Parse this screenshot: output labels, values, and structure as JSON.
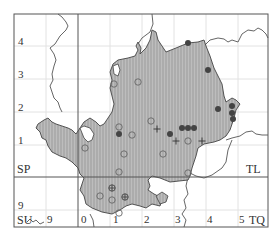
{
  "map": {
    "title": "",
    "colors": {
      "frame": "#555555",
      "grid": "#dddddd",
      "county_fill": "#b8b8b8",
      "hatch": "#9a9a9a",
      "outline": "#444444",
      "marker_dark": "#444444",
      "marker_open": "#666666"
    },
    "square_labels": {
      "sp": "SP",
      "tl": "TL",
      "su": "SU",
      "tq": "TQ"
    },
    "y_ticks": [
      "4",
      "3",
      "2",
      "1",
      "9"
    ],
    "x_ticks": [
      "9",
      "0",
      "1",
      "2",
      "3",
      "4",
      "5"
    ],
    "markers": {
      "filled": [
        {
          "x": 188,
          "y": 43
        },
        {
          "x": 208,
          "y": 70
        },
        {
          "x": 218,
          "y": 109
        },
        {
          "x": 232,
          "y": 106
        },
        {
          "x": 232,
          "y": 113
        },
        {
          "x": 233,
          "y": 119
        },
        {
          "x": 119,
          "y": 134
        },
        {
          "x": 170,
          "y": 134
        },
        {
          "x": 182,
          "y": 128
        },
        {
          "x": 188,
          "y": 128
        },
        {
          "x": 194,
          "y": 128
        }
      ],
      "open": [
        {
          "x": 138,
          "y": 82
        },
        {
          "x": 114,
          "y": 84
        },
        {
          "x": 119,
          "y": 127
        },
        {
          "x": 132,
          "y": 135
        },
        {
          "x": 151,
          "y": 121
        },
        {
          "x": 188,
          "y": 141
        },
        {
          "x": 124,
          "y": 154
        },
        {
          "x": 85,
          "y": 148
        },
        {
          "x": 163,
          "y": 154
        },
        {
          "x": 119,
          "y": 172
        },
        {
          "x": 100,
          "y": 196
        },
        {
          "x": 112,
          "y": 200
        },
        {
          "x": 188,
          "y": 173
        },
        {
          "x": 119,
          "y": 213
        }
      ],
      "plus": [
        {
          "x": 157,
          "y": 129
        },
        {
          "x": 176,
          "y": 141
        },
        {
          "x": 202,
          "y": 141
        }
      ],
      "plus_circle": [
        {
          "x": 112,
          "y": 188
        },
        {
          "x": 125,
          "y": 197
        }
      ]
    }
  }
}
